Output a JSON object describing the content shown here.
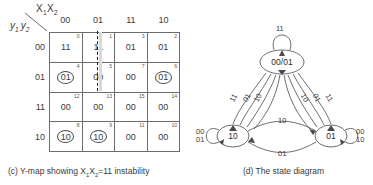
{
  "kmap": {
    "col_var_label": "X",
    "col_var_sub1": "1",
    "col_var_sub2": "X",
    "col_var_sub3": "2",
    "row_var_label": "y",
    "row_var_sub1": "1",
    "row_var_sub2": "y",
    "row_var_sub3": "2",
    "col_headers": [
      "00",
      "01",
      "11",
      "10"
    ],
    "row_headers": [
      "00",
      "01",
      "11",
      "10"
    ],
    "rows": [
      {
        "cells": [
          {
            "index": "0",
            "value": "11",
            "circled": false
          },
          {
            "index": "1",
            "value": "11",
            "circled": false
          },
          {
            "index": "3",
            "value": "01",
            "circled": false
          },
          {
            "index": "2",
            "value": "01",
            "circled": false
          }
        ]
      },
      {
        "cells": [
          {
            "index": "4",
            "value": "01",
            "circled": true
          },
          {
            "index": "5",
            "value": "00",
            "circled": false
          },
          {
            "index": "7",
            "value": "00",
            "circled": false
          },
          {
            "index": "6",
            "value": "01",
            "circled": true
          }
        ]
      },
      {
        "cells": [
          {
            "index": "12",
            "value": "00",
            "circled": false
          },
          {
            "index": "13",
            "value": "00",
            "circled": false
          },
          {
            "index": "15",
            "value": "00",
            "circled": false
          },
          {
            "index": "14",
            "value": "00",
            "circled": false
          }
        ]
      },
      {
        "cells": [
          {
            "index": "8",
            "value": "10",
            "circled": true
          },
          {
            "index": "9",
            "value": "10",
            "circled": true
          },
          {
            "index": "11",
            "value": "00",
            "circled": false
          },
          {
            "index": "10",
            "value": "00",
            "circled": false
          }
        ]
      }
    ]
  },
  "captions": {
    "c_prefix": "(c)  Y-map showing X",
    "c_sub1": "1",
    "c_mid": "X",
    "c_sub2": "2",
    "c_suffix": "=11 instability",
    "d": "(d)  The state diagram"
  },
  "state_diagram": {
    "nodes": [
      {
        "id": "top",
        "label": "00/01"
      },
      {
        "id": "left",
        "label": "10"
      },
      {
        "id": "right",
        "label": "01"
      }
    ],
    "self_loops": [
      {
        "node": "top",
        "label": "11"
      },
      {
        "node": "left",
        "label_line1": "00",
        "label_line2": "01"
      },
      {
        "node": "right",
        "label_line1": "00",
        "label_line2": "10"
      }
    ],
    "edges": [
      {
        "from": "top",
        "to": "left",
        "label": "11"
      },
      {
        "from": "top",
        "to": "left",
        "label": "01"
      },
      {
        "from": "left",
        "to": "top",
        "label": "10"
      },
      {
        "from": "right",
        "to": "top",
        "label": "10"
      },
      {
        "from": "top",
        "to": "right",
        "label": "01"
      },
      {
        "from": "top",
        "to": "right",
        "label": "11"
      },
      {
        "from": "left",
        "to": "right",
        "label": "10"
      },
      {
        "from": "right",
        "to": "left",
        "label": "01"
      }
    ]
  }
}
